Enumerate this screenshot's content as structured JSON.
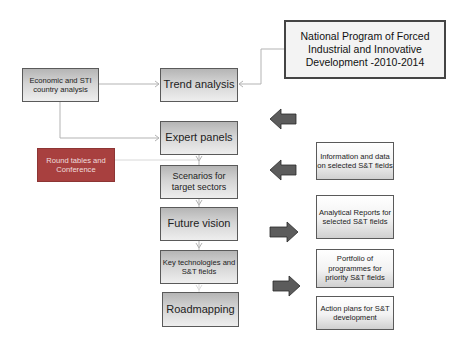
{
  "diagram": {
    "national_program": "National Program of Forced Industrial and Innovative Development -2010-2014",
    "left_inputs": {
      "economic": "Economic and STI country analysis",
      "round_tables": "Round tables and Conference"
    },
    "process_steps": [
      {
        "label": "Trend analysis"
      },
      {
        "label": "Expert panels"
      },
      {
        "label": "Scenarios for target sectors"
      },
      {
        "label": "Future vision"
      },
      {
        "label": "Key technologies and S&T fields"
      },
      {
        "label": "Roadmapping"
      }
    ],
    "outputs": [
      {
        "label": "Information and data on selected S&T fields"
      },
      {
        "label": "Analytical Reports for selected S&T fields"
      },
      {
        "label": "Portfolio of programmes for priority S&T fields"
      },
      {
        "label": "Action plans for S&T development"
      }
    ],
    "block_arrows": [
      {
        "direction": "left",
        "name": "arrow-to-expert-panels"
      },
      {
        "direction": "left",
        "name": "arrow-to-scenarios"
      },
      {
        "direction": "right",
        "name": "arrow-from-future-vision"
      },
      {
        "direction": "right",
        "name": "arrow-from-key-technologies"
      }
    ],
    "colors": {
      "step_fill": "#c8c8c8",
      "round_tables_fill": "#a8403f",
      "block_arrow": "#5a5a5a",
      "connector": "#b0b0b0"
    }
  }
}
